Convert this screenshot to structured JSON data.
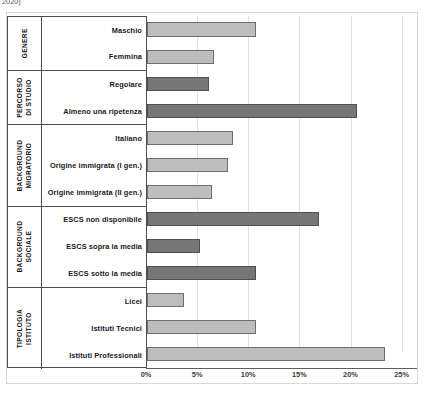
{
  "caption_fragment": "2020)",
  "chart_data": {
    "type": "bar",
    "orientation": "horizontal",
    "title": "",
    "xlabel": "",
    "ylabel": "",
    "xlim": [
      0,
      26.5
    ],
    "grid": true,
    "legend": "none",
    "xticks": [
      "0%",
      "5%",
      "10%",
      "15%",
      "20%",
      "25%"
    ],
    "xtick_values": [
      0,
      5,
      10,
      15,
      20,
      25
    ],
    "colors": {
      "light_bar": "#bdbdbd",
      "dark_bar": "#767676",
      "bar_border": "#6e6e6e",
      "gridline": "#e2e2e2",
      "axis": "#5e5e5e",
      "frame": "#d9d9d9",
      "label_border": "#4d4d4d",
      "text": "#1a1a1a"
    },
    "groups": [
      {
        "name": "GENERE",
        "name_lines": "GENERE",
        "categories": [
          "Maschio",
          "Femmina"
        ],
        "values": [
          10.7,
          6.6
        ],
        "shades": [
          "light",
          "light"
        ]
      },
      {
        "name": "PERCORSO DI STUDIO",
        "name_lines": "PERCORSO\nDI STUDIO",
        "categories": [
          "Regolare",
          "Almeno una ripetenza"
        ],
        "values": [
          6.1,
          20.5
        ],
        "shades": [
          "dark",
          "dark"
        ]
      },
      {
        "name": "BACKGROUND MIGRATORIO",
        "name_lines": "BACKGROUND\nMIGRATORIO",
        "categories": [
          "Italiano",
          "Origine immigrata (I gen.)",
          "Origine immigrata (II gen.)"
        ],
        "values": [
          8.4,
          7.9,
          6.4
        ],
        "shades": [
          "light",
          "light",
          "light"
        ]
      },
      {
        "name": "BACKGROUND SOCIALE",
        "name_lines": "BACKGROUND\nSOCIALE",
        "categories": [
          "ESCS non disponibile",
          "ESCS sopra la media",
          "ESCS sotto la media"
        ],
        "values": [
          16.8,
          5.2,
          10.7
        ],
        "shades": [
          "dark",
          "dark",
          "dark"
        ]
      },
      {
        "name": "TIPOLOGIA ISTITUTO",
        "name_lines": "TIPOLOGIA\nISTITUTO",
        "categories": [
          "Licei",
          "Istituti Tecnici",
          "Istituti Professionali"
        ],
        "values": [
          3.6,
          10.7,
          23.3
        ],
        "shades": [
          "light",
          "light",
          "light"
        ]
      }
    ]
  }
}
